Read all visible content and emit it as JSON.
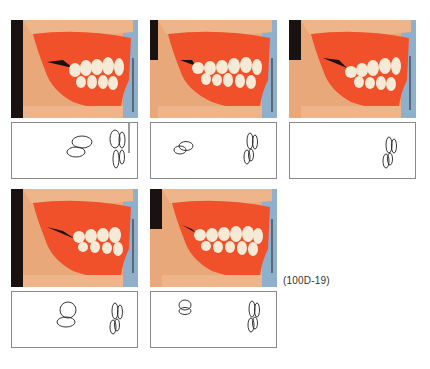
{
  "figure": {
    "caption": "(100D-19)",
    "panels": [
      {
        "id": 1,
        "row": 1,
        "col": 1,
        "description": "Lateral view of denture occlusion — anterior teeth protruded, upper teeth overlapping lower",
        "diagram": "incisor and molar cusp outline, vertical reference line"
      },
      {
        "id": 2,
        "row": 1,
        "col": 2,
        "description": "Lateral view of denture occlusion — intermediate position",
        "diagram": "incisor and molar cusp outline"
      },
      {
        "id": 3,
        "row": 1,
        "col": 3,
        "description": "Lateral view of denture occlusion — retruded position",
        "diagram": "molar cusp outline only"
      },
      {
        "id": 4,
        "row": 2,
        "col": 1,
        "description": "Lateral view of denture occlusion — edge to edge",
        "diagram": "incisor and molar cusp outline"
      },
      {
        "id": 5,
        "row": 2,
        "col": 2,
        "description": "Lateral view of denture occlusion — centric occlusion",
        "diagram": "incisor and molar cusp outline"
      }
    ]
  },
  "colors": {
    "gum": "#f0502a",
    "skin": "#eaa473",
    "teeth": "#f5ead6",
    "background_blue": "#8fb0cc",
    "shadow": "#1a1210",
    "line": "#222222",
    "border": "#8a8a8a"
  }
}
